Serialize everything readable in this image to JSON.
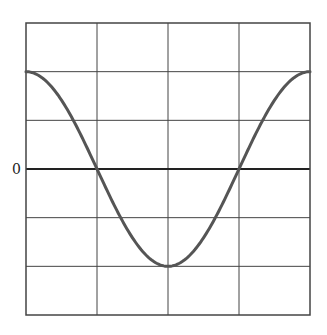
{
  "chart_data": {
    "type": "line",
    "title": "",
    "xlabel": "",
    "ylabel": "",
    "y_tick_labels": [
      {
        "value": 0,
        "label": "0"
      }
    ],
    "grid": true,
    "grid_divisions": {
      "x": 4,
      "y": 6
    },
    "xlim": [
      0,
      4
    ],
    "ylim": [
      -3,
      3
    ],
    "legend": null,
    "series": [
      {
        "name": "cosine waveform",
        "function": "2*cos(pi*x/2)",
        "x": [
          0,
          0.5,
          1,
          1.5,
          2,
          2.5,
          3,
          3.5,
          4
        ],
        "values": [
          2,
          1.41,
          0,
          -1.41,
          -2,
          -1.41,
          0,
          1.41,
          2
        ],
        "color": "#555555"
      }
    ]
  },
  "labels": {
    "zero": "0"
  },
  "colors": {
    "grid": "#444444",
    "curve": "#555555",
    "background": "#ffffff"
  }
}
